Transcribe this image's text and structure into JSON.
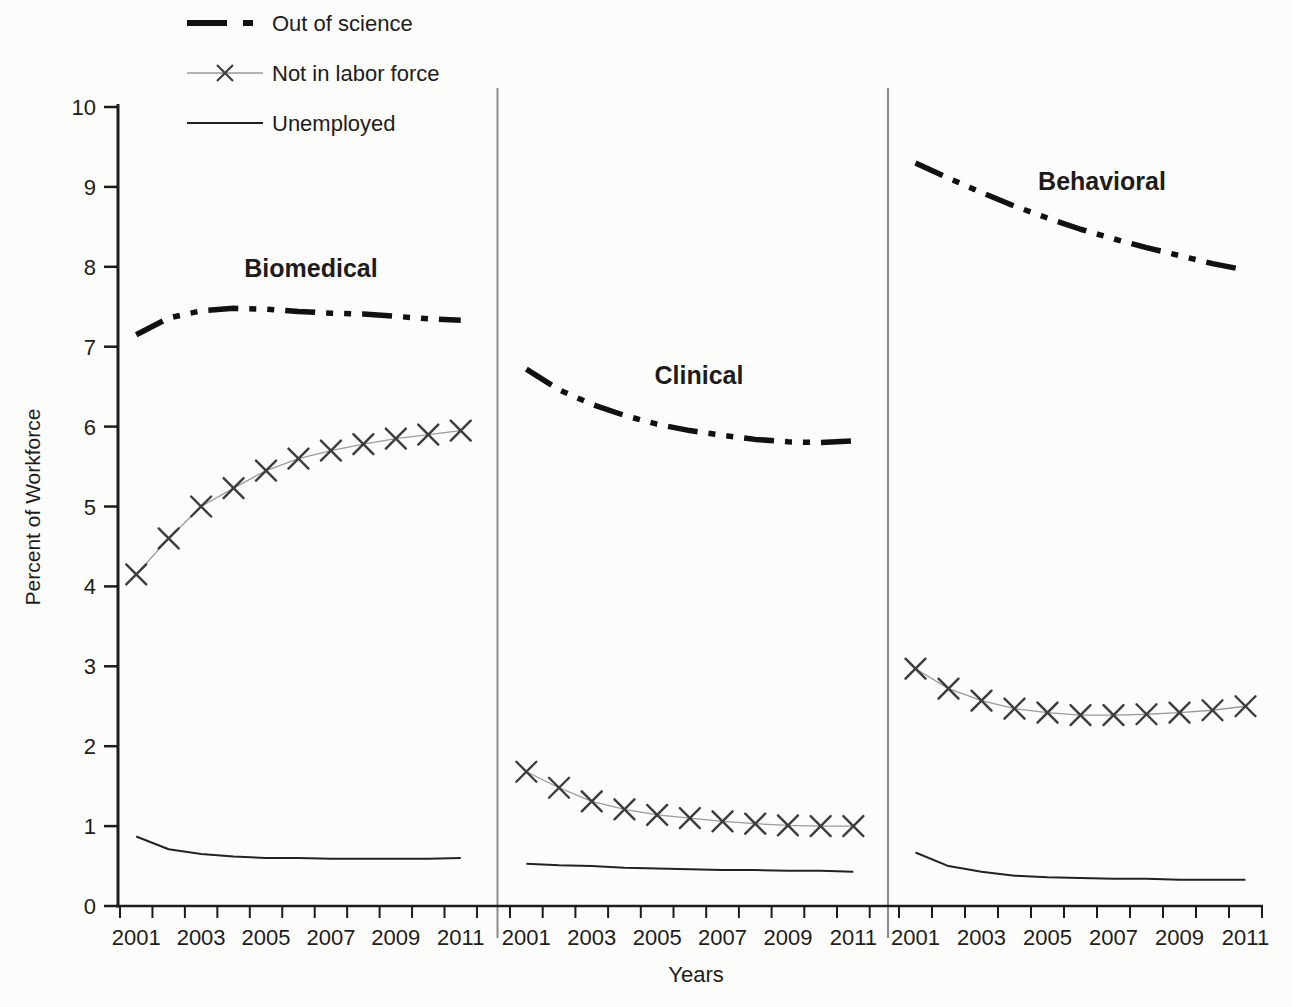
{
  "figure": {
    "background": "#fcfcfa",
    "ink": "#1c1c1c"
  },
  "colors": {
    "axis": "#1c1c1c",
    "out_of_science": "#111111",
    "nilf_line": "#9a9a9a",
    "nilf_marker": "#3c3c3c",
    "unemployed": "#222222",
    "separator": "#8a8a8a",
    "text": "#1c1c1c"
  },
  "chart_data": {
    "type": "line",
    "title": "",
    "xlabel": "Years",
    "ylabel": "Percent of Workforce",
    "ylim": [
      0,
      10
    ],
    "y_ticks": [
      0,
      1,
      2,
      3,
      4,
      5,
      6,
      7,
      8,
      9,
      10
    ],
    "x": [
      2001,
      2002,
      2003,
      2004,
      2005,
      2006,
      2007,
      2008,
      2009,
      2010,
      2011
    ],
    "x_labeled_years": [
      "2001",
      "2003",
      "2005",
      "2007",
      "2009",
      "2011"
    ],
    "grid": false,
    "legend_position": "top-left",
    "legend": [
      {
        "name": "Out of science",
        "style": "thick-dash-dot"
      },
      {
        "name": "Not in labor force",
        "style": "thin-line-x-marker"
      },
      {
        "name": "Unemployed",
        "style": "thin-solid"
      }
    ],
    "panels": [
      {
        "title": "Biomedical",
        "series": [
          {
            "name": "Out of science",
            "key": "out_of_science",
            "values": [
              7.15,
              7.36,
              7.45,
              7.48,
              7.47,
              7.44,
              7.42,
              7.41,
              7.38,
              7.35,
              7.33
            ]
          },
          {
            "name": "Not in labor force",
            "key": "not_in_labor_force",
            "values": [
              4.15,
              4.6,
              5.0,
              5.23,
              5.45,
              5.6,
              5.7,
              5.78,
              5.85,
              5.9,
              5.95
            ]
          },
          {
            "name": "Unemployed",
            "key": "unemployed",
            "values": [
              0.87,
              0.71,
              0.65,
              0.62,
              0.6,
              0.6,
              0.59,
              0.59,
              0.59,
              0.59,
              0.6
            ]
          }
        ]
      },
      {
        "title": "Clinical",
        "series": [
          {
            "name": "Out of science",
            "key": "out_of_science",
            "values": [
              6.72,
              6.46,
              6.28,
              6.14,
              6.03,
              5.95,
              5.89,
              5.84,
              5.81,
              5.8,
              5.82
            ]
          },
          {
            "name": "Not in labor force",
            "key": "not_in_labor_force",
            "values": [
              1.68,
              1.48,
              1.31,
              1.21,
              1.14,
              1.1,
              1.06,
              1.03,
              1.01,
              1.0,
              1.0
            ]
          },
          {
            "name": "Unemployed",
            "key": "unemployed",
            "values": [
              0.53,
              0.51,
              0.5,
              0.48,
              0.47,
              0.46,
              0.45,
              0.45,
              0.44,
              0.44,
              0.43
            ]
          }
        ]
      },
      {
        "title": "Behavioral",
        "series": [
          {
            "name": "Out of science",
            "key": "out_of_science",
            "values": [
              9.3,
              9.11,
              8.93,
              8.76,
              8.61,
              8.47,
              8.35,
              8.24,
              8.14,
              8.04,
              7.96
            ]
          },
          {
            "name": "Not in labor force",
            "key": "not_in_labor_force",
            "values": [
              2.97,
              2.72,
              2.57,
              2.47,
              2.42,
              2.39,
              2.39,
              2.4,
              2.42,
              2.45,
              2.5
            ]
          },
          {
            "name": "Unemployed",
            "key": "unemployed",
            "values": [
              0.67,
              0.5,
              0.43,
              0.38,
              0.36,
              0.35,
              0.34,
              0.34,
              0.33,
              0.33,
              0.33
            ]
          }
        ]
      }
    ]
  }
}
